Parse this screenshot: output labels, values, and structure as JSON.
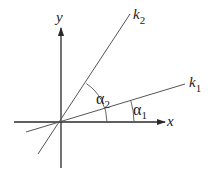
{
  "diagram": {
    "type": "coordinate-angle-diagram",
    "origin": {
      "x": 61,
      "y": 122
    },
    "axes": {
      "x": {
        "label": "x",
        "from": [
          14,
          122
        ],
        "to": [
          166,
          122
        ]
      },
      "y": {
        "label": "y",
        "from": [
          61,
          168
        ],
        "to": [
          61,
          27
        ]
      }
    },
    "lines": [
      {
        "id": "k2",
        "label_main": "k",
        "label_sub": "2",
        "from": [
          38,
          154
        ],
        "to": [
          130,
          14
        ]
      },
      {
        "id": "k1",
        "label_main": "k",
        "label_sub": "1",
        "from": [
          26,
          132
        ],
        "to": [
          185,
          84
        ]
      }
    ],
    "angles": [
      {
        "id": "alpha2",
        "label_main": "α",
        "label_sub": "2",
        "between": [
          "x",
          "k2"
        ],
        "radius": 46
      },
      {
        "id": "alpha1",
        "label_main": "α",
        "label_sub": "1",
        "between": [
          "x",
          "k1"
        ],
        "radius": 73
      }
    ],
    "colors": {
      "axis": "#2a2a2a",
      "line": "#555555",
      "text": "#222222",
      "background": "#ffffff"
    }
  }
}
